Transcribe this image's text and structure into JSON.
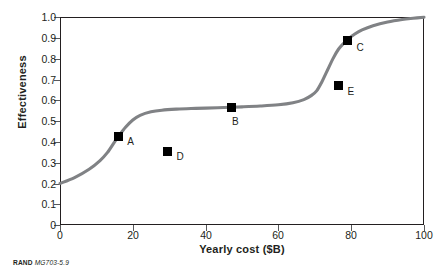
{
  "chart_data": {
    "type": "line",
    "title": "",
    "xlabel": "Yearly cost ($B)",
    "ylabel": "Effectiveness",
    "xlim": [
      0,
      100
    ],
    "ylim": [
      0,
      1.0
    ],
    "grid": false,
    "legend": "none",
    "xticks": [
      "0",
      "20",
      "40",
      "60",
      "80",
      "100"
    ],
    "xtick_values": [
      0,
      20,
      40,
      60,
      80,
      100
    ],
    "yticks": [
      "0",
      "0.1",
      "0.2",
      "0.3",
      "0.4",
      "0.5",
      "0.6",
      "0.7",
      "0.8",
      "0.9",
      "1.0"
    ],
    "ytick_values": [
      0,
      0.1,
      0.2,
      0.3,
      0.4,
      0.5,
      0.6,
      0.7,
      0.8,
      0.9,
      1.0
    ],
    "curve_color": "#808285",
    "marker_color": "#000000",
    "series": [
      {
        "name": "effectiveness-curve",
        "kind": "line",
        "x": [
          0,
          4,
          8,
          11,
          13,
          15,
          16,
          18,
          20,
          22,
          25,
          28,
          32,
          36,
          40,
          45,
          50,
          55,
          60,
          64,
          67,
          69,
          70.5,
          72,
          73.5,
          75,
          76.5,
          78,
          79,
          81,
          83,
          86,
          90,
          94,
          97,
          100
        ],
        "y": [
          0.2,
          0.228,
          0.268,
          0.31,
          0.348,
          0.4,
          0.425,
          0.47,
          0.505,
          0.527,
          0.544,
          0.552,
          0.557,
          0.56,
          0.562,
          0.565,
          0.568,
          0.572,
          0.578,
          0.588,
          0.603,
          0.622,
          0.645,
          0.69,
          0.745,
          0.8,
          0.845,
          0.875,
          0.892,
          0.918,
          0.938,
          0.958,
          0.976,
          0.988,
          0.994,
          0.999
        ]
      },
      {
        "name": "labeled-options",
        "kind": "scatter",
        "points": [
          {
            "label": "A",
            "x": 16.0,
            "y": 0.425,
            "label_dx": 9,
            "label_dy": 6
          },
          {
            "label": "B",
            "x": 47.0,
            "y": 0.565,
            "label_dx": 1,
            "label_dy": 16
          },
          {
            "label": "C",
            "x": 79.0,
            "y": 0.885,
            "label_dx": 9,
            "label_dy": 8
          },
          {
            "label": "D",
            "x": 29.5,
            "y": 0.355,
            "label_dx": 9,
            "label_dy": 7
          },
          {
            "label": "E",
            "x": 76.5,
            "y": 0.67,
            "label_dx": 9,
            "label_dy": 7
          }
        ]
      }
    ]
  },
  "caption": {
    "org": "RAND",
    "document_id": "MG703-5.9"
  }
}
